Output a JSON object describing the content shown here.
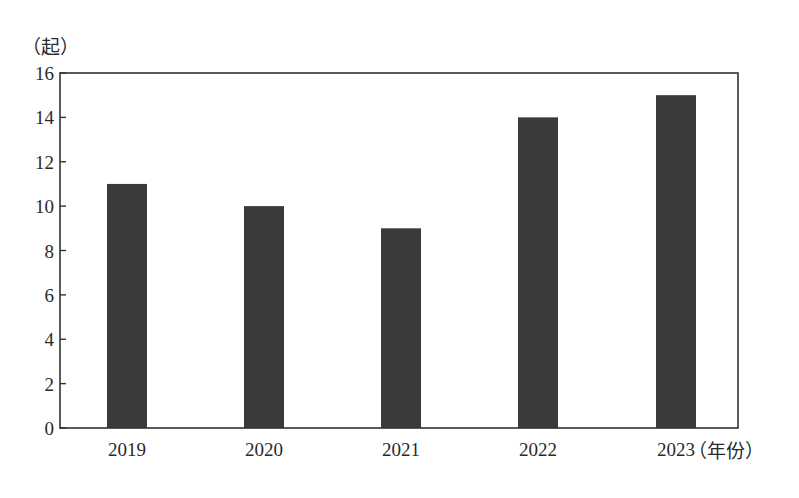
{
  "chart_data": {
    "type": "bar",
    "title": "",
    "xlabel": "（年份）",
    "ylabel": "（起）",
    "categories": [
      "2019",
      "2020",
      "2021",
      "2022",
      "2023"
    ],
    "values": [
      11,
      10,
      9,
      14,
      15
    ],
    "ylim": [
      0,
      16
    ],
    "yticks": [
      0,
      2,
      4,
      6,
      8,
      10,
      12,
      14,
      16
    ],
    "grid": false,
    "legend": null,
    "bar_color": "#3a3a3a"
  },
  "labels": {
    "y_unit": "（起）",
    "x_unit": "（年份）"
  }
}
